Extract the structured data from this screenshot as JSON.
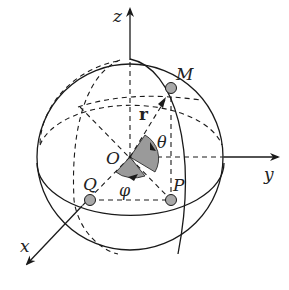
{
  "diagram": {
    "colors": {
      "stroke": "#1a1a1a",
      "point_fill": "#a8a8a8",
      "sector_fill": "#9a9a9a",
      "background": "#ffffff"
    },
    "axes": {
      "x": "x",
      "y": "y",
      "z": "z"
    },
    "origin": "O",
    "points": {
      "M": "M",
      "P": "P",
      "Q": "Q"
    },
    "vector": "r",
    "angles": {
      "polar": "θ",
      "azimuth": "φ"
    }
  }
}
